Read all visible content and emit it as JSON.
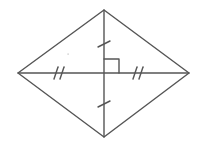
{
  "diagram": {
    "type": "geometry",
    "shape": "rhombus",
    "stroke_color": "#555555",
    "stroke_width": 1.4,
    "vertices": {
      "top": [
        104,
        10
      ],
      "right": [
        189,
        73
      ],
      "bottom": [
        104,
        137
      ],
      "left": [
        18,
        73
      ]
    },
    "center": [
      104,
      73
    ],
    "diagonals": [
      {
        "name": "vertical",
        "from": "top",
        "to": "bottom",
        "congruence_mark": "single-tick"
      },
      {
        "name": "horizontal",
        "from": "left",
        "to": "right",
        "congruence_mark": "double-tick"
      }
    ],
    "right_angle_marker": {
      "corner": [
        104,
        73
      ],
      "size": 15,
      "quadrant": "upper-right"
    },
    "tick_marks": [
      {
        "segment": "top-half-vertical",
        "count": 1,
        "at": [
          104,
          44
        ]
      },
      {
        "segment": "bottom-half-vertical",
        "count": 1,
        "at": [
          104,
          104
        ]
      },
      {
        "segment": "left-half-horizontal",
        "count": 2,
        "at": [
          59,
          73
        ]
      },
      {
        "segment": "right-half-horizontal",
        "count": 2,
        "at": [
          138,
          73
        ]
      }
    ],
    "artifacts": [
      {
        "type": "speck",
        "at": [
          68,
          54
        ]
      }
    ]
  }
}
